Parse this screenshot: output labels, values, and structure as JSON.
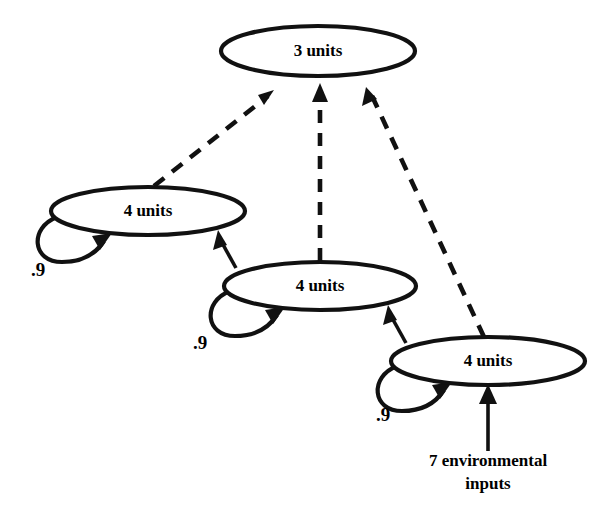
{
  "diagram": {
    "type": "node-link-diagram",
    "background_color": "#ffffff",
    "stroke_color": "#111111",
    "nodes": [
      {
        "id": "output",
        "label": "3 units",
        "cx": 318,
        "cy": 51,
        "rx": 97,
        "ry": 25
      },
      {
        "id": "hidden-left",
        "label": "4 units",
        "cx": 148,
        "cy": 211,
        "rx": 97,
        "ry": 24
      },
      {
        "id": "hidden-middle",
        "label": "4 units",
        "cx": 320,
        "cy": 286,
        "rx": 96,
        "ry": 24
      },
      {
        "id": "hidden-right",
        "label": "4 units",
        "cx": 488,
        "cy": 361,
        "rx": 97,
        "ry": 24
      }
    ],
    "self_loops": [
      {
        "id": "loop-hidden-left",
        "node": "hidden-left",
        "weight": ".9",
        "label_x": 38,
        "label_y": 272
      },
      {
        "id": "loop-hidden-middle",
        "node": "hidden-middle",
        "weight": ".9",
        "label_x": 200,
        "label_y": 345
      },
      {
        "id": "loop-hidden-right",
        "node": "hidden-right",
        "weight": ".9",
        "label_x": 383,
        "label_y": 417
      }
    ],
    "dashed_edges": [
      {
        "id": "edge-hidden-left-to-output",
        "from": "hidden-left",
        "to": "output",
        "style": "dashed",
        "x1": 154,
        "y1": 186,
        "x2": 274,
        "y2": 91
      },
      {
        "id": "edge-hidden-middle-to-output",
        "from": "hidden-middle",
        "to": "output",
        "style": "dashed",
        "x1": 320,
        "y1": 261,
        "x2": 320,
        "y2": 86
      },
      {
        "id": "edge-hidden-right-to-output",
        "from": "hidden-right",
        "to": "output",
        "style": "dashed",
        "x1": 484,
        "y1": 337,
        "x2": 366,
        "y2": 89
      }
    ],
    "solid_edges": [
      {
        "id": "edge-hidden-middle-to-hidden-left",
        "from": "hidden-middle",
        "to": "hidden-left",
        "style": "solid",
        "x1": 236,
        "y1": 268,
        "x2": 219,
        "y2": 232
      },
      {
        "id": "edge-hidden-right-to-hidden-middle",
        "from": "hidden-right",
        "to": "hidden-middle",
        "style": "solid",
        "x1": 406,
        "y1": 343,
        "x2": 389,
        "y2": 307
      },
      {
        "id": "edge-input-to-hidden-right",
        "from": "environmental-input",
        "to": "hidden-right",
        "style": "solid",
        "x1": 488,
        "y1": 451,
        "x2": 488,
        "y2": 387
      }
    ],
    "input_source": {
      "id": "environmental-input",
      "line1": "7 environmental",
      "line2": "inputs",
      "x": 488,
      "y1": 466,
      "y2": 489
    }
  }
}
